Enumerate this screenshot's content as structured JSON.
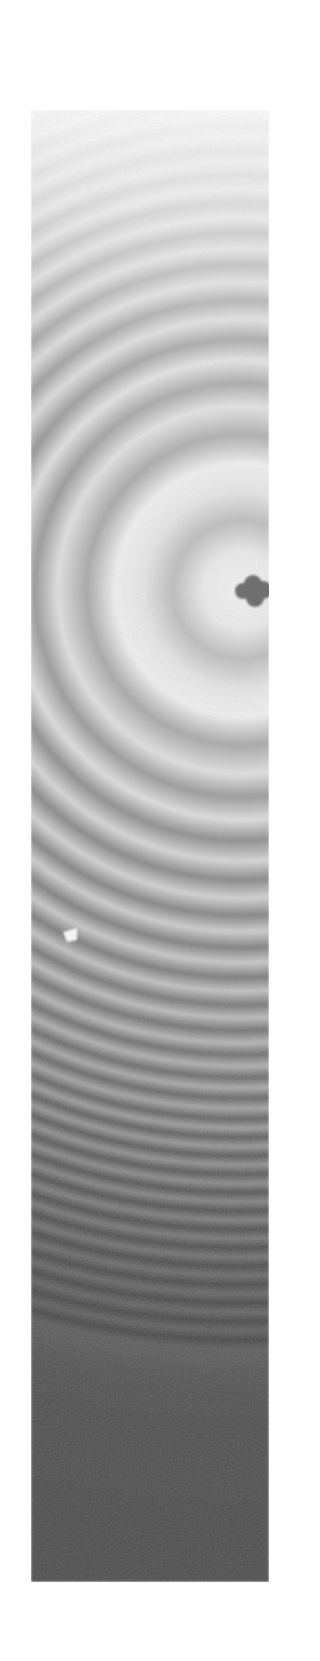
{
  "image": {
    "subject": "interference fringe pattern (concentric rings)",
    "colormode": "grayscale",
    "frame": {
      "x": 31,
      "y": 110,
      "width": 238,
      "height": 1472
    },
    "ring_center": {
      "x": 242,
      "y": 590
    },
    "center_defect": {
      "x": 242,
      "y": 590,
      "color": "#6f6f6f"
    },
    "bright_speck": {
      "x": 71,
      "y": 928,
      "color": "#f4f4f4"
    },
    "colors": {
      "background": "#ffffff",
      "top_tone": "#f2f2f2",
      "mid_light": "#d0d0d0",
      "mid_dark": "#8a8a8a",
      "bottom_tone": "#4d4d4d"
    }
  }
}
